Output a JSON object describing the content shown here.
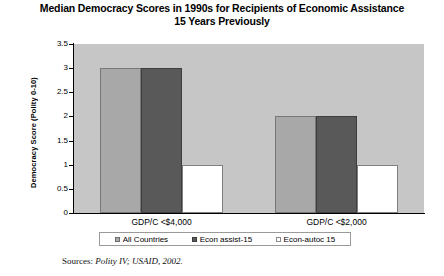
{
  "chart_data": {
    "type": "bar",
    "title": "Median Democracy Scores in 1990s for Recipients of Economic Assistance 15 Years Previously",
    "title_line1": "Median Democracy Scores in 1990s for Recipients of Economic Assistance",
    "title_line2": "15 Years Previously",
    "xlabel": "",
    "ylabel": "Democracy Score (Polity 0-10)",
    "categories": [
      "GDP/C <$4,000",
      "GDP/C <$2,000"
    ],
    "series": [
      {
        "name": "All Countries",
        "values": [
          3,
          2
        ],
        "color": "#a8a8a8"
      },
      {
        "name": "Econ assist-15",
        "values": [
          3,
          2
        ],
        "color": "#595959"
      },
      {
        "name": "Econ-autoc 15",
        "values": [
          1,
          1
        ],
        "color": "#ffffff"
      }
    ],
    "ylim": [
      0,
      3.5
    ],
    "yticks": [
      0,
      0.5,
      1,
      1.5,
      2,
      2.5,
      3,
      3.5
    ],
    "ytick_labels": [
      "0",
      "0.5",
      "1",
      "1.5",
      "2",
      "2.5",
      "3",
      "3.5"
    ],
    "grid": false,
    "legend_position": "bottom",
    "plot_background": "#c6c6c6"
  },
  "source": {
    "prefix": "Sources: ",
    "citation": "Polity IV; USAID, 2002."
  }
}
